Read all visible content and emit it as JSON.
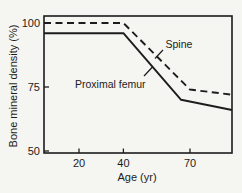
{
  "figure": {
    "background_color": "#f5f5f2",
    "ink_color": "#1c1c1c"
  },
  "chart_data": {
    "type": "line",
    "title": "",
    "xlabel": "Age (yr)",
    "ylabel": "Bone mineral density (%)",
    "xlim": [
      4,
      89
    ],
    "ylim": [
      50,
      103
    ],
    "xticks": [
      20,
      40,
      70
    ],
    "yticks": [
      50,
      75,
      100
    ],
    "grid": false,
    "legend_position": "inline-annotations",
    "series": [
      {
        "name": "Spine",
        "style": "dashed",
        "color": "#1c1c1c",
        "x": [
          4,
          40,
          70,
          89
        ],
        "y": [
          100,
          100,
          74,
          72
        ]
      },
      {
        "name": "Proximal femur",
        "style": "solid",
        "color": "#1c1c1c",
        "x": [
          4,
          40,
          66,
          89
        ],
        "y": [
          96,
          96,
          70,
          66
        ]
      }
    ]
  }
}
